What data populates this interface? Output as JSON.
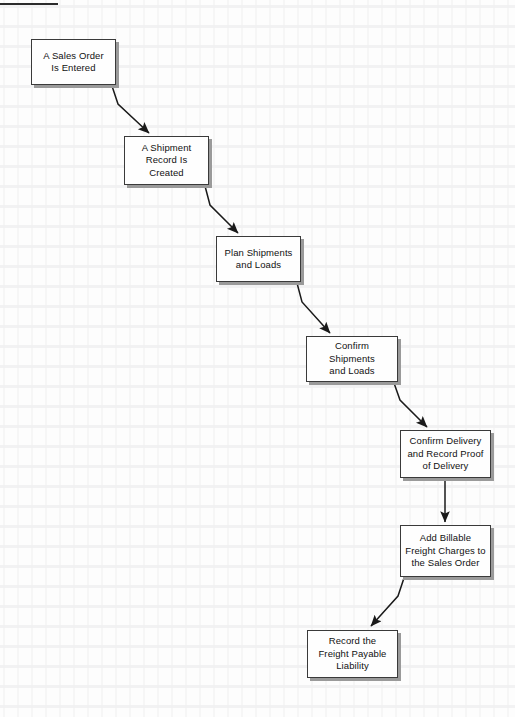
{
  "page": {
    "top_rule_visible": true,
    "background_color": "#fdfdfd",
    "box_fill_color": "#fefefe",
    "box_border_color": "#3a3a3a",
    "box_shadow_color": "#9a9a9a",
    "connector_color": "#1a1a1a"
  },
  "flowchart": {
    "type": "process-flow",
    "orientation": "cascading-diagonal",
    "step_count": 7,
    "nodes": [
      {
        "id": "node-1",
        "order": 1,
        "label": "A Sales Order\nIs Entered",
        "x": 31,
        "y": 39,
        "w": 85,
        "h": 46
      },
      {
        "id": "node-2",
        "order": 2,
        "label": "A Shipment\nRecord Is\nCreated",
        "x": 124,
        "y": 136,
        "w": 85,
        "h": 49
      },
      {
        "id": "node-3",
        "order": 3,
        "label": "Plan Shipments\nand Loads",
        "x": 216,
        "y": 236,
        "w": 85,
        "h": 46
      },
      {
        "id": "node-4",
        "order": 4,
        "label": "Confirm Shipments\nand Loads",
        "x": 306,
        "y": 336,
        "w": 92,
        "h": 46
      },
      {
        "id": "node-5",
        "order": 5,
        "label": "Confirm Delivery\nand Record Proof\nof Delivery",
        "x": 400,
        "y": 430,
        "w": 91,
        "h": 48
      },
      {
        "id": "node-6",
        "order": 6,
        "label": "Add Billable\nFreight Charges to\nthe Sales Order",
        "x": 400,
        "y": 525,
        "w": 91,
        "h": 52
      },
      {
        "id": "node-7",
        "order": 7,
        "label": "Record the\nFreight Payable\nLiability",
        "x": 307,
        "y": 630,
        "w": 91,
        "h": 48
      }
    ],
    "connectors": [
      {
        "id": "edge-1-2",
        "from": "node-1",
        "to": "node-2",
        "shape": "diagonal-down-right"
      },
      {
        "id": "edge-2-3",
        "from": "node-2",
        "to": "node-3",
        "shape": "diagonal-down-right"
      },
      {
        "id": "edge-3-4",
        "from": "node-3",
        "to": "node-4",
        "shape": "diagonal-down-right"
      },
      {
        "id": "edge-4-5",
        "from": "node-4",
        "to": "node-5",
        "shape": "diagonal-down-right"
      },
      {
        "id": "edge-5-6",
        "from": "node-5",
        "to": "node-6",
        "shape": "vertical-down"
      },
      {
        "id": "edge-6-7",
        "from": "node-6",
        "to": "node-7",
        "shape": "diagonal-down-left"
      }
    ]
  }
}
